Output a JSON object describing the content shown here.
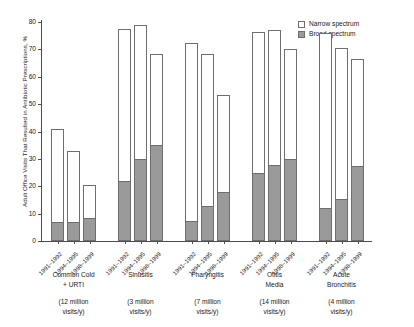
{
  "chart_data": {
    "type": "bar",
    "subtype": "stacked-grouped",
    "title": "",
    "xlabel": "",
    "ylabel": "Adult Office Visits That Resulted in Antibiotic Prescriptions, %",
    "ylim": [
      0,
      80
    ],
    "yticks": [
      0,
      10,
      20,
      30,
      40,
      50,
      60,
      70,
      80
    ],
    "grid": false,
    "legend_position": "top-right",
    "legend": [
      {
        "label": "Narrow spectrum",
        "color": "#ffffff",
        "key": "narrow"
      },
      {
        "label": "Broad spectrum",
        "color": "#9a9a9a",
        "key": "broad"
      }
    ],
    "categories": [
      "1991-1992",
      "1994-1995",
      "1998-1999"
    ],
    "groups": [
      {
        "name": "Common Cold\n+ URTI",
        "visits": "(12 million\nvisits/y)",
        "bars": [
          {
            "period": "1991–1992",
            "total": 40.8,
            "broad": 6.5,
            "narrow": 34.3
          },
          {
            "period": "1994–1995",
            "total": 32.8,
            "broad": 6.6,
            "narrow": 26.2
          },
          {
            "period": "1998–1999",
            "total": 20.6,
            "broad": 8.0,
            "narrow": 12.6
          }
        ]
      },
      {
        "name": "Sinusitis",
        "visits": "(3 million\nvisits/y)",
        "bars": [
          {
            "period": "1991–1992",
            "total": 77.4,
            "broad": 21.6,
            "narrow": 55.8
          },
          {
            "period": "1994–1995",
            "total": 78.8,
            "broad": 29.5,
            "narrow": 49.3
          },
          {
            "period": "1998–1999",
            "total": 68.3,
            "broad": 34.8,
            "narrow": 33.5
          }
        ]
      },
      {
        "name": "Pharyngitis",
        "visits": "(7 million\nvisits/y)",
        "bars": [
          {
            "period": "1991–1992",
            "total": 72.4,
            "broad": 7.0,
            "narrow": 65.4
          },
          {
            "period": "1994–1995",
            "total": 68.3,
            "broad": 12.6,
            "narrow": 55.7
          },
          {
            "period": "1998–1999",
            "total": 53.3,
            "broad": 17.5,
            "narrow": 35.8
          }
        ]
      },
      {
        "name": "Otitis\nMedia",
        "visits": "(14 million\nvisits/y)",
        "bars": [
          {
            "period": "1991–1992",
            "total": 76.5,
            "broad": 24.6,
            "narrow": 51.9
          },
          {
            "period": "1994–1995",
            "total": 77.0,
            "broad": 27.4,
            "narrow": 49.6
          },
          {
            "period": "1998–1999",
            "total": 70.0,
            "broad": 29.6,
            "narrow": 40.4
          }
        ]
      },
      {
        "name": "Acute\nBronchitis",
        "visits": "(4 million\nvisits/y)",
        "bars": [
          {
            "period": "1991–1992",
            "total": 76.0,
            "broad": 11.6,
            "narrow": 64.4
          },
          {
            "period": "1994–1995",
            "total": 70.5,
            "broad": 15.0,
            "narrow": 55.5
          },
          {
            "period": "1998–1999",
            "total": 66.5,
            "broad": 27.0,
            "narrow": 39.5
          }
        ]
      }
    ]
  }
}
